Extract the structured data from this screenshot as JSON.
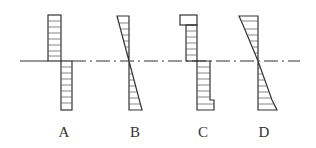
{
  "diagram": {
    "title": "",
    "colors": {
      "line": "#333333",
      "hatch": "#555555",
      "background": "#ffffff"
    },
    "axis": {
      "y": 61,
      "x_start": 20,
      "x_end": 300,
      "style": "dash-dot"
    },
    "options": [
      {
        "label": "A",
        "label_x": 64,
        "shape": "two opposite rectangles (uniform distribution, sign reversal at axis)"
      },
      {
        "label": "B",
        "label_x": 135,
        "shape": "two opposite triangles (linear distribution through zero at axis)"
      },
      {
        "label": "C",
        "label_x": 203,
        "shape": "rectangles with wider end steps at top and bottom"
      },
      {
        "label": "D",
        "label_x": 264,
        "shape": "triangles with kinked end portions at top and bottom"
      }
    ]
  }
}
